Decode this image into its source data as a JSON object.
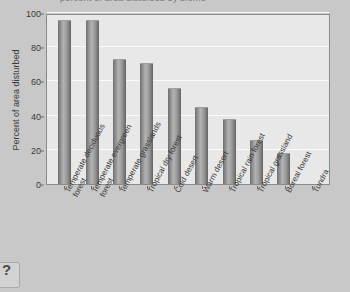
{
  "chart_data": {
    "type": "bar",
    "title": "",
    "xlabel": "",
    "ylabel": "Percent of area disturbed",
    "ylim": [
      0,
      100
    ],
    "yticks": [
      0,
      20,
      40,
      60,
      80,
      100
    ],
    "grid": true,
    "legend": null,
    "categories": [
      "Temperate deciduous forest",
      "Temperate evergreen forest",
      "Temperate grasslands",
      "Tropical dry forest",
      "Cold desert",
      "Warm desert",
      "Tropical rain forest",
      "Tropical grassland",
      "Boreal forest",
      "Tundra"
    ],
    "category_lines": [
      [
        "Temperate deciduous",
        "forest"
      ],
      [
        "Temperate evergreen",
        "forest"
      ],
      [
        "Temperate grasslands"
      ],
      [
        "Tropical dry forest"
      ],
      [
        "Cold desert"
      ],
      [
        "Warm desert"
      ],
      [
        "Tropical rain forest"
      ],
      [
        "Tropical grassland"
      ],
      [
        "Boreal forest"
      ],
      [
        "Tundra"
      ]
    ],
    "values": [
      96,
      96,
      73,
      71,
      56,
      45,
      38,
      26,
      18,
      0
    ],
    "bar_color": "#8d8d8d",
    "plot_background": "#e8e8e8",
    "page_background": "#c8c8c8",
    "gridline_color": "#fbfbfb"
  },
  "title_strip": {
    "text": "percent of area disturbed by biome"
  },
  "corner_widget": {
    "glyph": "?"
  }
}
